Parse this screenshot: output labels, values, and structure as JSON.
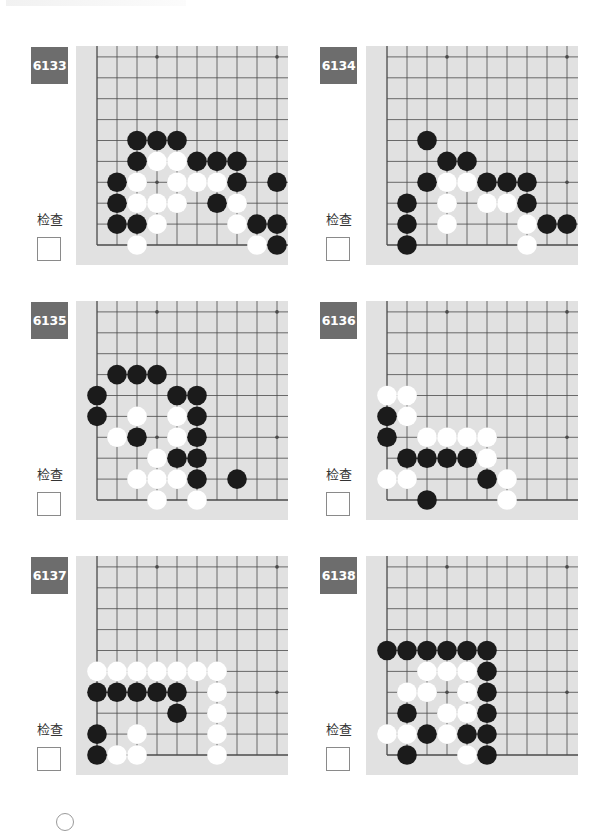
{
  "page": {
    "check_label": "检查",
    "colors": {
      "board": "#e1e1e1",
      "grid": "#4a4a4a",
      "black_stone": "#1b1b1b",
      "white_stone": "#ffffff",
      "badge": "#6d6d6d"
    }
  },
  "board_spec": {
    "visible_cols": 10,
    "visible_rows": 10,
    "origin": "bottom-left corner (col 0 = left edge, row 0 = bottom edge)",
    "star_points": [
      [
        3,
        3
      ],
      [
        9,
        3
      ],
      [
        3,
        9
      ],
      [
        9,
        9
      ]
    ]
  },
  "problems": [
    {
      "number": "6133",
      "check_label": "检查",
      "black": [
        [
          2,
          5
        ],
        [
          3,
          5
        ],
        [
          4,
          5
        ],
        [
          2,
          4
        ],
        [
          5,
          4
        ],
        [
          6,
          4
        ],
        [
          7,
          4
        ],
        [
          1,
          3
        ],
        [
          7,
          3
        ],
        [
          9,
          3
        ],
        [
          1,
          2
        ],
        [
          6,
          2
        ],
        [
          1,
          1
        ],
        [
          2,
          1
        ],
        [
          8,
          1
        ],
        [
          9,
          1
        ],
        [
          9,
          0
        ]
      ],
      "white": [
        [
          3,
          4
        ],
        [
          4,
          4
        ],
        [
          2,
          3
        ],
        [
          4,
          3
        ],
        [
          5,
          3
        ],
        [
          6,
          3
        ],
        [
          2,
          2
        ],
        [
          3,
          2
        ],
        [
          4,
          2
        ],
        [
          7,
          2
        ],
        [
          3,
          1
        ],
        [
          7,
          1
        ],
        [
          2,
          0
        ],
        [
          8,
          0
        ]
      ]
    },
    {
      "number": "6134",
      "check_label": "检查",
      "black": [
        [
          2,
          5
        ],
        [
          3,
          4
        ],
        [
          4,
          4
        ],
        [
          2,
          3
        ],
        [
          5,
          3
        ],
        [
          6,
          3
        ],
        [
          7,
          3
        ],
        [
          1,
          2
        ],
        [
          7,
          2
        ],
        [
          1,
          1
        ],
        [
          8,
          1
        ],
        [
          9,
          1
        ],
        [
          1,
          0
        ]
      ],
      "white": [
        [
          3,
          3
        ],
        [
          4,
          3
        ],
        [
          3,
          2
        ],
        [
          5,
          2
        ],
        [
          6,
          2
        ],
        [
          3,
          1
        ],
        [
          7,
          1
        ],
        [
          7,
          0
        ]
      ]
    },
    {
      "number": "6135",
      "check_label": "检查",
      "black": [
        [
          1,
          6
        ],
        [
          2,
          6
        ],
        [
          3,
          6
        ],
        [
          0,
          5
        ],
        [
          4,
          5
        ],
        [
          5,
          5
        ],
        [
          0,
          4
        ],
        [
          5,
          4
        ],
        [
          2,
          3
        ],
        [
          5,
          3
        ],
        [
          4,
          2
        ],
        [
          5,
          2
        ],
        [
          5,
          1
        ],
        [
          7,
          1
        ]
      ],
      "white": [
        [
          2,
          4
        ],
        [
          4,
          4
        ],
        [
          1,
          3
        ],
        [
          4,
          3
        ],
        [
          3,
          2
        ],
        [
          2,
          1
        ],
        [
          3,
          1
        ],
        [
          4,
          1
        ],
        [
          3,
          0
        ],
        [
          5,
          0
        ]
      ]
    },
    {
      "number": "6136",
      "check_label": "检查",
      "black": [
        [
          0,
          4
        ],
        [
          0,
          3
        ],
        [
          1,
          2
        ],
        [
          2,
          2
        ],
        [
          3,
          2
        ],
        [
          4,
          2
        ],
        [
          5,
          1
        ],
        [
          2,
          0
        ]
      ],
      "white": [
        [
          0,
          5
        ],
        [
          1,
          5
        ],
        [
          1,
          4
        ],
        [
          2,
          3
        ],
        [
          3,
          3
        ],
        [
          4,
          3
        ],
        [
          5,
          3
        ],
        [
          5,
          2
        ],
        [
          0,
          1
        ],
        [
          1,
          1
        ],
        [
          6,
          1
        ],
        [
          6,
          0
        ]
      ]
    },
    {
      "number": "6137",
      "check_label": "检查",
      "black": [
        [
          0,
          3
        ],
        [
          1,
          3
        ],
        [
          2,
          3
        ],
        [
          3,
          3
        ],
        [
          4,
          3
        ],
        [
          4,
          2
        ],
        [
          0,
          1
        ],
        [
          0,
          0
        ]
      ],
      "white": [
        [
          0,
          4
        ],
        [
          1,
          4
        ],
        [
          2,
          4
        ],
        [
          3,
          4
        ],
        [
          4,
          4
        ],
        [
          5,
          4
        ],
        [
          6,
          4
        ],
        [
          6,
          3
        ],
        [
          6,
          2
        ],
        [
          2,
          1
        ],
        [
          6,
          1
        ],
        [
          1,
          0
        ],
        [
          2,
          0
        ],
        [
          6,
          0
        ]
      ]
    },
    {
      "number": "6138",
      "check_label": "检查",
      "black": [
        [
          0,
          5
        ],
        [
          1,
          5
        ],
        [
          2,
          5
        ],
        [
          3,
          5
        ],
        [
          4,
          5
        ],
        [
          5,
          5
        ],
        [
          5,
          4
        ],
        [
          5,
          3
        ],
        [
          1,
          2
        ],
        [
          5,
          2
        ],
        [
          2,
          1
        ],
        [
          4,
          1
        ],
        [
          5,
          1
        ],
        [
          1,
          0
        ],
        [
          5,
          0
        ]
      ],
      "white": [
        [
          2,
          4
        ],
        [
          3,
          4
        ],
        [
          4,
          4
        ],
        [
          1,
          3
        ],
        [
          2,
          3
        ],
        [
          4,
          3
        ],
        [
          3,
          2
        ],
        [
          4,
          2
        ],
        [
          0,
          1
        ],
        [
          1,
          1
        ],
        [
          3,
          1
        ],
        [
          4,
          0
        ]
      ]
    }
  ]
}
